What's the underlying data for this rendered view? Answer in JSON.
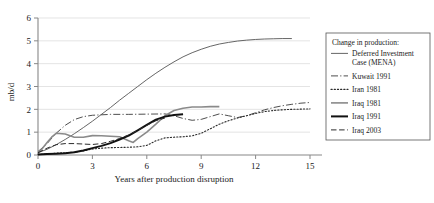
{
  "chart_data": {
    "type": "line",
    "title": "",
    "xlabel": "Years after production disruption",
    "ylabel": "mb/d",
    "xlim": [
      0,
      15
    ],
    "ylim": [
      0,
      6
    ],
    "xticks": [
      "0",
      "3",
      "6",
      "9",
      "12",
      "15"
    ],
    "xtick_values": [
      0,
      3,
      6,
      9,
      12,
      15
    ],
    "yticks": [
      "0",
      "1",
      "2",
      "3",
      "4",
      "5",
      "6"
    ],
    "ytick_values": [
      0,
      1,
      2,
      3,
      4,
      5,
      6
    ],
    "grid": "horizontal",
    "legend_position": "right",
    "legend_title": "Change in production:",
    "series": [
      {
        "name": "Deferred Investment Case (MENA)",
        "style": "solid-thin",
        "color": "#555555",
        "width": 0.9,
        "x": [
          0,
          0.5,
          1,
          1.5,
          2,
          2.5,
          3,
          3.5,
          4,
          4.5,
          5,
          5.5,
          6,
          6.5,
          7,
          7.5,
          8,
          8.5,
          9,
          9.5,
          10,
          10.5,
          11,
          11.5,
          12,
          12.5,
          13,
          13.5,
          14
        ],
        "values": [
          0.1,
          0.25,
          0.45,
          0.68,
          0.93,
          1.2,
          1.48,
          1.78,
          2.08,
          2.4,
          2.7,
          3.0,
          3.3,
          3.58,
          3.84,
          4.08,
          4.3,
          4.48,
          4.63,
          4.76,
          4.86,
          4.93,
          4.99,
          5.03,
          5.06,
          5.08,
          5.09,
          5.1,
          5.1
        ]
      },
      {
        "name": "Kuwait 1991",
        "style": "dash-dot",
        "color": "#3a3a3a",
        "width": 0.9,
        "x": [
          0,
          0.5,
          1,
          1.5,
          2,
          2.5,
          3,
          4,
          5,
          6,
          7,
          7.5,
          8,
          8.5,
          9,
          9.5,
          10,
          10.5,
          11,
          11.5,
          12,
          12.5,
          13,
          13.5,
          14,
          14.5,
          15
        ],
        "values": [
          0.15,
          0.5,
          0.95,
          1.3,
          1.55,
          1.68,
          1.74,
          1.78,
          1.78,
          1.79,
          1.8,
          1.72,
          1.6,
          1.52,
          1.56,
          1.68,
          1.8,
          1.72,
          1.64,
          1.72,
          1.85,
          1.98,
          2.08,
          2.16,
          2.22,
          2.27,
          2.3
        ]
      },
      {
        "name": "Iran 1981",
        "style": "dotted",
        "color": "#2b2b2b",
        "width": 1.1,
        "x": [
          0,
          0.5,
          1,
          1.5,
          2,
          2.5,
          3,
          3.5,
          4,
          4.5,
          5,
          5.5,
          6,
          6.5,
          7,
          7.5,
          8,
          8.5,
          9,
          9.5,
          10,
          10.5,
          11,
          11.5,
          12,
          12.5,
          13,
          13.5,
          14,
          14.5,
          15
        ],
        "values": [
          0.02,
          0.05,
          0.08,
          0.1,
          0.12,
          0.18,
          0.26,
          0.3,
          0.32,
          0.33,
          0.34,
          0.36,
          0.42,
          0.62,
          0.75,
          0.78,
          0.8,
          0.84,
          0.95,
          1.15,
          1.35,
          1.5,
          1.62,
          1.72,
          1.82,
          1.9,
          1.95,
          1.98,
          2.0,
          2.01,
          2.02
        ]
      },
      {
        "name": "Iraq 1981",
        "style": "solid-gray",
        "color": "#8a8a8a",
        "width": 1.6,
        "x": [
          0,
          0.25,
          0.5,
          0.75,
          1,
          1.5,
          2,
          2.5,
          3,
          3.5,
          4,
          4.5,
          5,
          5.25,
          5.5,
          6,
          6.5,
          7,
          7.5,
          8,
          8.5,
          9,
          9.5,
          10
        ],
        "values": [
          0.05,
          0.3,
          0.55,
          0.78,
          0.95,
          0.92,
          0.78,
          0.78,
          0.85,
          0.84,
          0.82,
          0.8,
          0.62,
          0.55,
          0.72,
          1.0,
          1.35,
          1.72,
          1.95,
          2.05,
          2.1,
          2.1,
          2.12,
          2.12
        ]
      },
      {
        "name": "Iraq 1991",
        "style": "solid-thick",
        "color": "#111111",
        "width": 2.0,
        "x": [
          0,
          0.5,
          1,
          1.5,
          2,
          2.5,
          3,
          3.5,
          4,
          4.5,
          5,
          5.5,
          6,
          6.5,
          7,
          7.5,
          8
        ],
        "values": [
          0.02,
          0.04,
          0.06,
          0.08,
          0.12,
          0.2,
          0.3,
          0.4,
          0.52,
          0.68,
          0.85,
          1.08,
          1.32,
          1.55,
          1.68,
          1.75,
          1.78
        ]
      },
      {
        "name": "Iraq 2003",
        "style": "dashed",
        "color": "#2b2b2b",
        "width": 1.0,
        "x": [
          0,
          0.5,
          1,
          1.5,
          2,
          2.5,
          3,
          3.5,
          4,
          4.5,
          5,
          5.5,
          6,
          6.5,
          7
        ],
        "values": [
          0.1,
          0.3,
          0.45,
          0.5,
          0.5,
          0.48,
          0.46,
          0.5,
          0.6,
          0.72,
          0.88,
          1.08,
          1.3,
          1.5,
          1.62
        ]
      }
    ]
  },
  "legend": {
    "title": "Change in production:",
    "items": [
      {
        "label": "Deferred Investment Case (MENA)",
        "style": "solid-thin"
      },
      {
        "label": "Kuwait 1991",
        "style": "dash-dot"
      },
      {
        "label": "Iran 1981",
        "style": "dotted"
      },
      {
        "label": "Iraq 1981",
        "style": "solid-gray"
      },
      {
        "label": "Iraq 1991",
        "style": "solid-thick"
      },
      {
        "label": "Iraq 2003",
        "style": "dashed"
      }
    ]
  }
}
